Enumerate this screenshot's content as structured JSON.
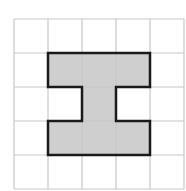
{
  "diagram": {
    "type": "grid-shape",
    "grid": {
      "columns": 5,
      "rows": 5,
      "cell_size_px": 34,
      "origin_px": [
        14,
        19
      ],
      "line_color": "#c8c8c8"
    },
    "shape": {
      "name": "I-shape",
      "fill_color": "#cfcfcf",
      "outline_color": "#1a1a1a",
      "cells": [
        [
          1,
          1
        ],
        [
          2,
          1
        ],
        [
          3,
          1
        ],
        [
          2,
          2
        ],
        [
          1,
          3
        ],
        [
          2,
          3
        ],
        [
          3,
          3
        ]
      ],
      "outline_cells": [
        [
          1,
          1
        ],
        [
          4,
          1
        ],
        [
          4,
          2
        ],
        [
          3,
          2
        ],
        [
          3,
          3
        ],
        [
          4,
          3
        ],
        [
          4,
          4
        ],
        [
          1,
          4
        ],
        [
          1,
          3
        ],
        [
          2,
          3
        ],
        [
          2,
          2
        ],
        [
          1,
          2
        ]
      ]
    }
  }
}
